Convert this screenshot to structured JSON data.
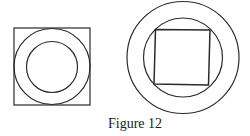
{
  "caption": "Figure 12",
  "colors": {
    "stroke": "#2a2a2a",
    "background": "#ffffff"
  },
  "figures": [
    {
      "name": "square-with-inscribed-circles",
      "square": {
        "x": 14,
        "y": 28,
        "w": 76,
        "h": 77
      },
      "outer_circle": {
        "cx": 52,
        "cy": 66.5,
        "r": 38
      },
      "inner_circle": {
        "cx": 52,
        "cy": 67,
        "r": 25.5
      }
    },
    {
      "name": "circles-with-inscribed-square",
      "outer_circle": {
        "cx": 183,
        "cy": 57.5,
        "r": 56
      },
      "inner_circle": {
        "cx": 183,
        "cy": 57.5,
        "r": 39.5
      },
      "square_points": "155.5,29.5 210,30 208.5,85 154,84"
    }
  ]
}
